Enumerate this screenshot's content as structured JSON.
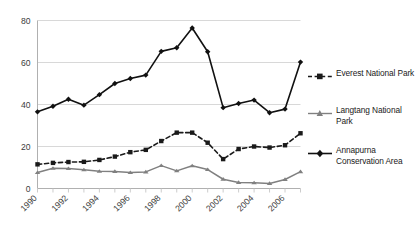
{
  "chart_data": {
    "type": "line",
    "title": "",
    "xlabel": "",
    "ylabel": "",
    "ylim": [
      0,
      80
    ],
    "yticks": [
      0,
      20,
      40,
      60,
      80
    ],
    "xticks_labeled": [
      "1990",
      "1992",
      "1994",
      "1996",
      "1998",
      "2000",
      "2002",
      "2004",
      "2006"
    ],
    "grid": "horizontal",
    "legend_position": "right",
    "x": [
      1990,
      1991,
      1992,
      1993,
      1994,
      1995,
      1996,
      1997,
      1998,
      1999,
      2000,
      2001,
      2002,
      2003,
      2004,
      2005,
      2006,
      2007
    ],
    "series": [
      {
        "name": "Everest National Park",
        "color": "#1a1a1a",
        "marker": "square",
        "dash": "dashed",
        "values": [
          11.5,
          12.2,
          12.6,
          12.7,
          13.6,
          15.2,
          17.3,
          18.4,
          22.6,
          26.6,
          26.6,
          21.8,
          14.0,
          18.8,
          20.0,
          19.5,
          20.6,
          26.3
        ]
      },
      {
        "name": "Langtang National Park",
        "color": "#808080",
        "marker": "triangle",
        "dash": "solid",
        "values": [
          7.6,
          9.6,
          9.5,
          8.9,
          8.2,
          8.1,
          7.6,
          7.9,
          10.9,
          8.4,
          10.8,
          9.0,
          4.4,
          2.9,
          2.7,
          2.4,
          4.3,
          8.0
        ]
      },
      {
        "name": "Annapurna Conservation Area",
        "color": "#111111",
        "marker": "diamond",
        "dash": "solid",
        "values": [
          36.5,
          39.2,
          42.5,
          39.7,
          44.7,
          50.0,
          52.4,
          54.0,
          65.3,
          67.0,
          76.4,
          65.1,
          38.5,
          40.5,
          42.1,
          36.1,
          37.8,
          60.2
        ]
      }
    ]
  },
  "legend": {
    "items": [
      {
        "label": "Everest National Park"
      },
      {
        "label": "Langtang National Park"
      },
      {
        "label": "Annapurna Conservation Area"
      }
    ]
  }
}
